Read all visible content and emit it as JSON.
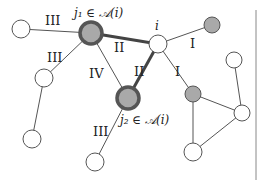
{
  "diagram": {
    "type": "graph",
    "nodes": [
      {
        "id": "n_left",
        "x": 21,
        "y": 29,
        "r": 9,
        "style": "white"
      },
      {
        "id": "j1",
        "x": 91,
        "y": 33,
        "r": 11,
        "style": "ring",
        "label": "j₁ ∈ 𝒜(i)"
      },
      {
        "id": "i",
        "x": 158,
        "y": 44,
        "r": 9,
        "style": "white",
        "label": "i"
      },
      {
        "id": "n_tr",
        "x": 212,
        "y": 25,
        "r": 8,
        "style": "gray"
      },
      {
        "id": "n_lm",
        "x": 44,
        "y": 78,
        "r": 9,
        "style": "white"
      },
      {
        "id": "n_ll",
        "x": 32,
        "y": 139,
        "r": 9,
        "style": "white"
      },
      {
        "id": "j2",
        "x": 128,
        "y": 98,
        "r": 11,
        "style": "ring",
        "label": "j₂ ∈ 𝒜(i)"
      },
      {
        "id": "n_bm",
        "x": 95,
        "y": 162,
        "r": 9,
        "style": "white"
      },
      {
        "id": "n_rg",
        "x": 193,
        "y": 94,
        "r": 8,
        "style": "gray"
      },
      {
        "id": "n_rt",
        "x": 234,
        "y": 60,
        "r": 8,
        "style": "white"
      },
      {
        "id": "n_rr",
        "x": 242,
        "y": 113,
        "r": 8,
        "style": "white"
      },
      {
        "id": "n_rb",
        "x": 193,
        "y": 152,
        "r": 9,
        "style": "white"
      }
    ],
    "edges": [
      {
        "from": "n_left",
        "to": "j1",
        "label": "III",
        "lx": 45,
        "ly": 25,
        "thick": false
      },
      {
        "from": "j1",
        "to": "n_lm",
        "label": "III",
        "lx": 47,
        "ly": 62,
        "thick": false
      },
      {
        "from": "n_lm",
        "to": "n_ll",
        "label": "",
        "thick": false
      },
      {
        "from": "j1",
        "to": "i",
        "label": "II",
        "lx": 114,
        "ly": 52,
        "thick": true
      },
      {
        "from": "j1",
        "to": "j2",
        "label": "IV",
        "lx": 89,
        "ly": 78,
        "thick": false
      },
      {
        "from": "i",
        "to": "j2",
        "label": "II",
        "lx": 134,
        "ly": 76,
        "thick": true
      },
      {
        "from": "i",
        "to": "n_tr",
        "label": "I",
        "lx": 190,
        "ly": 48,
        "thick": false
      },
      {
        "from": "i",
        "to": "n_rg",
        "label": "I",
        "lx": 175,
        "ly": 76,
        "thick": false
      },
      {
        "from": "j2",
        "to": "n_bm",
        "label": "III",
        "lx": 93,
        "ly": 136,
        "thick": false
      },
      {
        "from": "n_rg",
        "to": "n_rr",
        "label": "",
        "thick": false
      },
      {
        "from": "n_rg",
        "to": "n_rb",
        "label": "",
        "thick": false
      },
      {
        "from": "n_rr",
        "to": "n_rb",
        "label": "",
        "thick": false
      },
      {
        "from": "n_rt",
        "to": "n_rr",
        "label": "",
        "thick": false
      }
    ],
    "annotations": {
      "j1": {
        "text": "j₁ ∈ 𝒜(i)",
        "x": 74,
        "y": 17
      },
      "i": {
        "text": "i",
        "x": 155,
        "y": 30
      },
      "j2": {
        "text": "j₂ ∈ 𝒜(i)",
        "x": 120,
        "y": 124
      }
    },
    "divider": {
      "x": 256,
      "y1": 10,
      "y2": 180
    }
  }
}
